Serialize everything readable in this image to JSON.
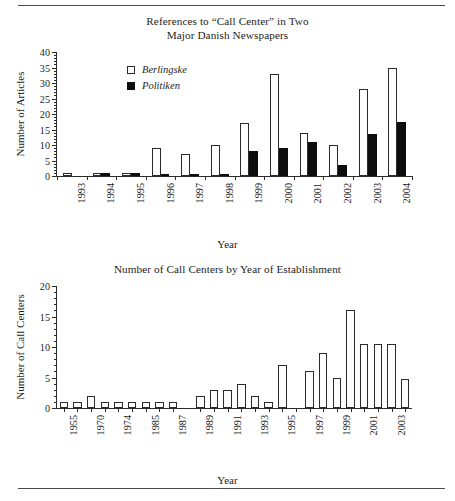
{
  "page": {
    "rule_top": "horizontal-rule",
    "rule_bottom": "horizontal-rule"
  },
  "figure_top": {
    "title_line1": "References to “Call Center” in Two",
    "title_line2": "Major Danish Newspapers",
    "legend": [
      {
        "label": "Berlingske",
        "style": "open"
      },
      {
        "label": "Politiken",
        "style": "filled"
      }
    ]
  },
  "figure_bottom": {
    "title_line1": "Number of Call Centers by Year of Establishment"
  },
  "chart_data": [
    {
      "type": "bar",
      "title": "References to “Call Center” in Two Major Danish Newspapers",
      "xlabel": "Year",
      "ylabel": "Number of Articles",
      "ylim": [
        0,
        40
      ],
      "yticks": [
        0,
        5,
        10,
        15,
        20,
        25,
        30,
        35,
        40
      ],
      "ytick_labels": [
        "0",
        "5",
        "10",
        "15",
        "20",
        "25",
        "30",
        "35",
        "40"
      ],
      "grid": false,
      "legend_position": "top-left",
      "categories": [
        "1993",
        "1994",
        "1995",
        "1996",
        "1997",
        "1998",
        "1999",
        "2000",
        "2001",
        "2002",
        "2003",
        "2004"
      ],
      "series": [
        {
          "name": "Berlingske",
          "style": "open",
          "values": [
            1,
            1,
            1,
            9,
            7,
            10,
            17,
            33,
            14,
            10,
            28,
            35
          ]
        },
        {
          "name": "Politiken",
          "style": "filled",
          "values": [
            0,
            1,
            1,
            0.7,
            0.7,
            0.7,
            8,
            9,
            11,
            3.5,
            13.5,
            17.5
          ]
        }
      ]
    },
    {
      "type": "bar",
      "title": "Number of Call Centers by Year of Establishment",
      "xlabel": "Year",
      "ylabel": "Number of Call Centers",
      "ylim": [
        0,
        20
      ],
      "yticks": [
        0,
        5,
        10,
        15,
        20
      ],
      "ytick_labels": [
        "0",
        "5",
        "10",
        "15",
        "20"
      ],
      "grid": false,
      "legend_position": "none",
      "bar_style": "open",
      "categories": [
        "1955",
        "1969",
        "1970",
        "1973",
        "1974",
        "1984",
        "1985",
        "1986",
        "1987",
        "1989",
        "1990",
        "1991",
        "1992",
        "1993",
        "1994",
        "1995",
        "1996",
        "1997",
        "1998",
        "1999",
        "2000",
        "2001",
        "2002",
        "2003",
        "2004"
      ],
      "tick_labels": [
        "1955",
        "",
        "1970",
        "",
        "1974",
        "",
        "1985",
        "",
        "1987",
        "1989",
        "",
        "1991",
        "",
        "1993",
        "",
        "1995",
        "",
        "1997",
        "",
        "1999",
        "",
        "2001",
        "",
        "2003",
        ""
      ],
      "values": [
        1,
        1,
        2,
        1,
        1,
        1,
        1,
        1,
        1,
        2,
        3,
        3,
        4,
        2,
        1,
        7,
        0,
        6,
        9,
        5,
        16,
        10.5,
        10.5,
        10.5,
        4.7
      ],
      "gap_after_index": 8
    }
  ]
}
